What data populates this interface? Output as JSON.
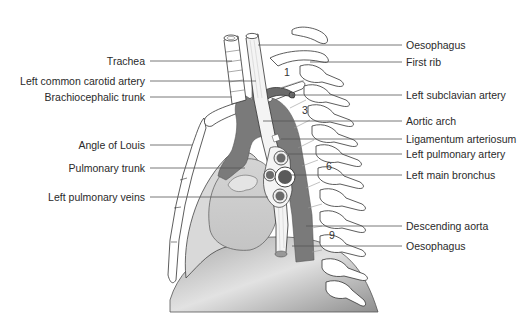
{
  "diagram": {
    "left_labels": [
      {
        "id": "trachea",
        "text": "Trachea",
        "y": 61,
        "line_to": [
          232,
          61
        ]
      },
      {
        "id": "left-common-carotid",
        "text": "Left common carotid artery",
        "y": 81,
        "line_to": [
          256,
          81
        ]
      },
      {
        "id": "brachiocephalic-trunk",
        "text": "Brachiocephalic trunk",
        "y": 97,
        "line_to": [
          232,
          97
        ]
      },
      {
        "id": "angle-of-louis",
        "text": "Angle of Louis",
        "y": 145,
        "line_to": [
          192,
          145
        ]
      },
      {
        "id": "pulmonary-trunk",
        "text": "Pulmonary trunk",
        "y": 168,
        "line_to": [
          245,
          168
        ]
      },
      {
        "id": "left-pulmonary-veins",
        "text": "Left pulmonary veins",
        "y": 197,
        "line_to": [
          268,
          197
        ]
      }
    ],
    "right_labels": [
      {
        "id": "oesophagus-top",
        "text": "Oesophagus",
        "y": 45,
        "line_from": [
          258,
          45
        ]
      },
      {
        "id": "first-rib",
        "text": "First rib",
        "y": 62,
        "line_from": [
          310,
          62
        ]
      },
      {
        "id": "left-subclavian",
        "text": "Left subclavian artery",
        "y": 95,
        "line_from": [
          292,
          95
        ]
      },
      {
        "id": "aortic-arch",
        "text": "Aortic arch",
        "y": 121,
        "line_from": [
          263,
          121
        ]
      },
      {
        "id": "ligamentum-arteriosum",
        "text": "Ligamentum arteriosum",
        "y": 139,
        "line_from": [
          281,
          139
        ]
      },
      {
        "id": "left-pulmonary-artery",
        "text": "Left pulmonary artery",
        "y": 154,
        "line_from": [
          288,
          154
        ]
      },
      {
        "id": "left-main-bronchus",
        "text": "Left main bronchus",
        "y": 175,
        "line_from": [
          290,
          175
        ]
      },
      {
        "id": "descending-aorta",
        "text": "Descending aorta",
        "y": 226,
        "line_from": [
          306,
          226
        ]
      },
      {
        "id": "oesophagus-bottom",
        "text": "Oesophagus",
        "y": 246,
        "line_from": [
          292,
          246
        ]
      }
    ],
    "vertebra_numbers": [
      {
        "text": "1",
        "x": 284,
        "y": 73
      },
      {
        "text": "3",
        "x": 302,
        "y": 110
      },
      {
        "text": "6",
        "x": 326,
        "y": 166
      },
      {
        "text": "9",
        "x": 329,
        "y": 235
      }
    ],
    "colors": {
      "aorta": "#7d7d7d",
      "heart": "#cfcfcf",
      "lung_outline": "#444444",
      "diaphragm_dark": "#9a9a9a",
      "diaphragm_light": "#e6e6e6",
      "leader_line": "#555555",
      "bone_fill": "#ffffff",
      "bone_stroke": "#333333"
    }
  }
}
